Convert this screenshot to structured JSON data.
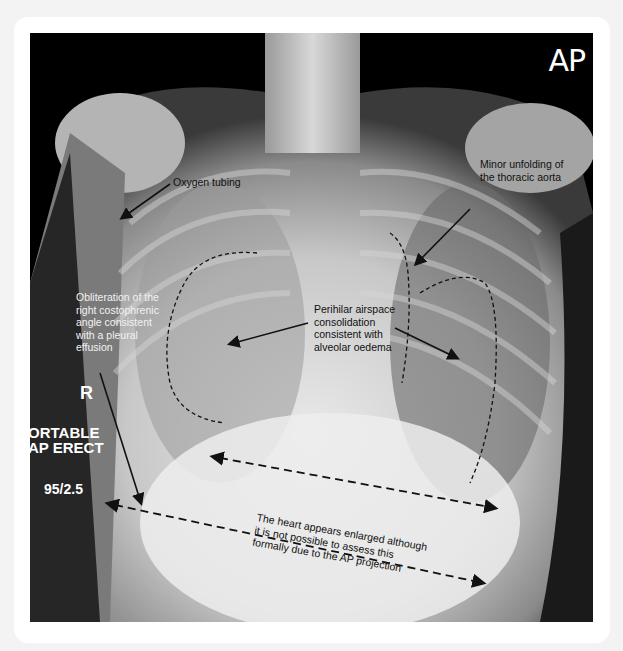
{
  "image": {
    "view_label": "AP",
    "side_marker": "R",
    "technique_lines": [
      "ORTABLE",
      "AP ERECT"
    ],
    "exposure": "95/2.5"
  },
  "annotations": {
    "oxygen_tubing": "Oxygen tubing",
    "aorta": [
      "Minor unfolding of",
      "the thoracic aorta"
    ],
    "effusion": [
      "Obliteration of the",
      "right costophrenic",
      "angle consistent",
      "with a pleural",
      "effusion"
    ],
    "consolidation": [
      "Perihilar airspace",
      "consolidation",
      "consistent with",
      "alveolar oedema"
    ],
    "heart": [
      "The heart appears enlarged although",
      "it is not possible to assess this",
      "formally due to the AP projection"
    ]
  },
  "colors": {
    "background": "#f3f3f3",
    "card": "#ffffff",
    "annotation_dark": "#111111",
    "annotation_light": "#f2f2f2"
  }
}
